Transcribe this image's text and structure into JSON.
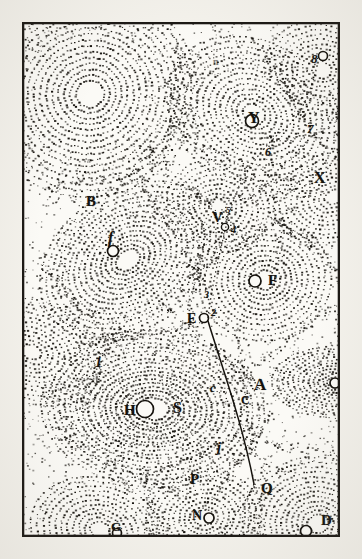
{
  "plate": {
    "title": "Descartes vortex plate",
    "description": "Stipple-engraved cosmological plate showing a field of contiguous fluid vortices, each with a central star or planet, and a comet trajectory crossing several vortices.",
    "medium": "copperplate stipple engraving",
    "frame": {
      "visible": true,
      "border_color": "#1b1814",
      "paper_color": "#f4f2ec",
      "field_color": "#fbfaf6",
      "x": 22,
      "y": 22,
      "w": 318,
      "h": 515
    },
    "ink_color": "#15120d"
  },
  "chart_data": {
    "type": "scatter",
    "xlabel": "",
    "ylabel": "",
    "xlim": [
      0,
      318
    ],
    "ylim": [
      0,
      515
    ],
    "grid": false,
    "legend": null,
    "series": [
      {
        "name": "vortex-centres",
        "values": [
          {
            "label": "S",
            "x": 131,
            "y": 387,
            "marker": "circle",
            "note": "central sun, elliptical rings"
          },
          {
            "label": "H",
            "x": 108,
            "y": 390,
            "marker": "text"
          },
          {
            "label": "f",
            "x": 91,
            "y": 223,
            "marker": "circle"
          },
          {
            "label": "B",
            "x": 68,
            "y": 180,
            "marker": "text"
          },
          {
            "label": "F",
            "x": 241,
            "y": 259,
            "marker": "circle"
          },
          {
            "label": "Y",
            "x": 237,
            "y": 98,
            "marker": "circle"
          },
          {
            "label": "X",
            "x": 298,
            "y": 155,
            "marker": "text"
          },
          {
            "label": "V",
            "x": 196,
            "y": 196,
            "marker": "text"
          },
          {
            "label": "L",
            "x": 322,
            "y": 361,
            "marker": "circle"
          },
          {
            "label": "D",
            "x": 294,
            "y": 500,
            "marker": "circle"
          },
          {
            "label": "N",
            "x": 181,
            "y": 494,
            "marker": "circle"
          },
          {
            "label": "G",
            "x": 93,
            "y": 506,
            "marker": "circle"
          },
          {
            "label": "A",
            "x": 238,
            "y": 364,
            "marker": "text"
          },
          {
            "label": "P",
            "x": 173,
            "y": 458,
            "marker": "text"
          },
          {
            "label": "Q",
            "x": 243,
            "y": 467,
            "marker": "text"
          },
          {
            "label": "R",
            "x": 194,
            "y": 526,
            "marker": "text"
          },
          {
            "label": "M",
            "x": 186,
            "y": 536,
            "marker": "text"
          },
          {
            "label": "E",
            "x": 174,
            "y": 297,
            "marker": "circle"
          },
          {
            "label": "C",
            "x": 223,
            "y": 379,
            "marker": "text"
          },
          {
            "label": "c",
            "x": 191,
            "y": 366,
            "marker": "text"
          },
          {
            "label": "j",
            "x": 196,
            "y": 427,
            "marker": "text"
          }
        ]
      },
      {
        "name": "comet-path-waypoints",
        "values": [
          {
            "label": "1",
            "x": 75,
            "y": 341
          },
          {
            "label": "2",
            "x": 192,
            "y": 294
          },
          {
            "label": "3",
            "x": 185,
            "y": 274
          },
          {
            "label": "4",
            "x": 211,
            "y": 207
          },
          {
            "label": "5",
            "x": 206,
            "y": 189
          },
          {
            "label": "6",
            "x": 246,
            "y": 130
          },
          {
            "label": "7",
            "x": 288,
            "y": 107
          },
          {
            "label": "8",
            "x": 295,
            "y": 36
          },
          {
            "label": "n",
            "x": 195,
            "y": 40
          }
        ]
      }
    ],
    "annotations": [
      {
        "text": "comet trajectory",
        "type": "line",
        "from": {
          "x": 186,
          "y": 299
        },
        "to": {
          "x": 232,
          "y": 462
        }
      }
    ]
  },
  "labels": [
    {
      "id": "label-8",
      "text": "8",
      "x": 289,
      "y": 30,
      "size": 13,
      "style": "italic"
    },
    {
      "id": "label-8-circle",
      "text": "",
      "x": 301,
      "y": 32,
      "size": 0,
      "style": "circle"
    },
    {
      "id": "label-n",
      "text": "n",
      "x": 191,
      "y": 35,
      "size": 10,
      "style": "faint"
    },
    {
      "id": "label-Y",
      "text": "Y",
      "x": 226,
      "y": 88,
      "size": 16,
      "style": "roman"
    },
    {
      "id": "label-7",
      "text": "7",
      "x": 285,
      "y": 100,
      "size": 13,
      "style": "italic"
    },
    {
      "id": "label-6",
      "text": "6",
      "x": 243,
      "y": 124,
      "size": 12,
      "style": "italic"
    },
    {
      "id": "label-X",
      "text": "X",
      "x": 292,
      "y": 148,
      "size": 16,
      "style": "roman"
    },
    {
      "id": "label-B",
      "text": "B",
      "x": 64,
      "y": 172,
      "size": 15,
      "style": "roman"
    },
    {
      "id": "label-V",
      "text": "V",
      "x": 190,
      "y": 188,
      "size": 15,
      "style": "roman"
    },
    {
      "id": "label-5",
      "text": "5",
      "x": 204,
      "y": 184,
      "size": 9,
      "style": "italic"
    },
    {
      "id": "label-4",
      "text": "4",
      "x": 209,
      "y": 203,
      "size": 10,
      "style": "italic"
    },
    {
      "id": "label-f",
      "text": "f",
      "x": 86,
      "y": 208,
      "size": 16,
      "style": "italic"
    },
    {
      "id": "label-F",
      "text": "F",
      "x": 246,
      "y": 251,
      "size": 15,
      "style": "roman"
    },
    {
      "id": "label-3",
      "text": "3",
      "x": 182,
      "y": 268,
      "size": 10,
      "style": "italic"
    },
    {
      "id": "label-E",
      "text": "E",
      "x": 165,
      "y": 290,
      "size": 14,
      "style": "roman"
    },
    {
      "id": "label-2",
      "text": "2",
      "x": 189,
      "y": 286,
      "size": 10,
      "style": "italic"
    },
    {
      "id": "label-1",
      "text": "1",
      "x": 73,
      "y": 334,
      "size": 14,
      "style": "italic"
    },
    {
      "id": "label-L",
      "text": "L",
      "x": 327,
      "y": 353,
      "size": 15,
      "style": "roman"
    },
    {
      "id": "label-c",
      "text": "c",
      "x": 188,
      "y": 360,
      "size": 12,
      "style": "italic"
    },
    {
      "id": "label-A",
      "text": "A",
      "x": 232,
      "y": 354,
      "size": 17,
      "style": "roman"
    },
    {
      "id": "label-C",
      "text": "C",
      "x": 219,
      "y": 372,
      "size": 12,
      "style": "roman"
    },
    {
      "id": "label-H",
      "text": "H",
      "x": 102,
      "y": 381,
      "size": 15,
      "style": "roman"
    },
    {
      "id": "label-S",
      "text": "S",
      "x": 151,
      "y": 378,
      "size": 16,
      "style": "roman"
    },
    {
      "id": "label-j",
      "text": "j",
      "x": 195,
      "y": 419,
      "size": 14,
      "style": "italic"
    },
    {
      "id": "label-P",
      "text": "P",
      "x": 168,
      "y": 450,
      "size": 15,
      "style": "roman"
    },
    {
      "id": "label-Q",
      "text": "Q",
      "x": 239,
      "y": 459,
      "size": 15,
      "style": "roman"
    },
    {
      "id": "label-N",
      "text": "N",
      "x": 170,
      "y": 487,
      "size": 14,
      "style": "roman"
    },
    {
      "id": "label-D",
      "text": "D",
      "x": 299,
      "y": 491,
      "size": 15,
      "style": "roman"
    },
    {
      "id": "label-G",
      "text": "G",
      "x": 89,
      "y": 498,
      "size": 13,
      "style": "roman"
    },
    {
      "id": "label-R",
      "text": "R",
      "x": 190,
      "y": 518,
      "size": 13,
      "style": "roman"
    },
    {
      "id": "label-M",
      "text": "M",
      "x": 182,
      "y": 528,
      "size": 13,
      "style": "roman"
    }
  ]
}
